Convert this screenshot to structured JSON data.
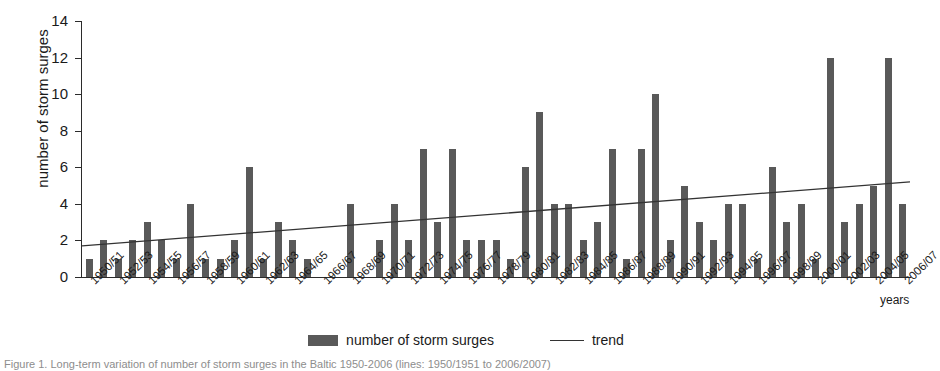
{
  "chart_data": {
    "type": "bar",
    "title": "",
    "xlabel": "years",
    "ylabel": "number of storm surges",
    "ylim": [
      0,
      14
    ],
    "yticks": [
      0,
      2,
      4,
      6,
      8,
      10,
      12,
      14
    ],
    "grid": false,
    "legend_position": "bottom",
    "categories": [
      "1950/51",
      "1951/52",
      "1952/53",
      "1953/54",
      "1954/55",
      "1955/56",
      "1956/57",
      "1957/58",
      "1958/59",
      "1959/60",
      "1960/61",
      "1961/62",
      "1962/63",
      "1963/64",
      "1964/65",
      "1965/66",
      "1966/67",
      "1967/68",
      "1968/69",
      "1969/70",
      "1970/71",
      "1971/72",
      "1972/73",
      "1973/74",
      "1974/75",
      "1975/76",
      "1976/77",
      "1977/78",
      "1978/79",
      "1979/80",
      "1980/81",
      "1981/82",
      "1982/83",
      "1983/84",
      "1984/85",
      "1985/86",
      "1986/87",
      "1987/88",
      "1988/89",
      "1989/90",
      "1990/91",
      "1991/92",
      "1992/93",
      "1993/94",
      "1994/95",
      "1995/96",
      "1996/97",
      "1997/98",
      "1998/99",
      "1999/00",
      "2000/01",
      "2001/02",
      "2002/03",
      "2003/04",
      "2004/05",
      "2005/06",
      "2006/07"
    ],
    "tick_labels": [
      "1950/51",
      "1952/53",
      "1954/55",
      "1956/57",
      "1958/59",
      "1960/61",
      "1962/63",
      "1964/65",
      "1966/67",
      "1968/69",
      "1970/71",
      "1972/73",
      "1974/75",
      "1976/77",
      "1978/79",
      "1980/81",
      "1982/83",
      "1984/85",
      "1986/87",
      "1988/89",
      "1990/91",
      "1992/93",
      "1994/95",
      "1996/97",
      "1998/99",
      "2000/01",
      "2002/03",
      "2004/05",
      "2006/07"
    ],
    "series": [
      {
        "name": "number of storm surges",
        "color": "#595959",
        "values": [
          1,
          2,
          1,
          2,
          3,
          2,
          1,
          4,
          1,
          1,
          2,
          6,
          1,
          3,
          2,
          1,
          0,
          0,
          4,
          0,
          2,
          4,
          2,
          7,
          3,
          7,
          2,
          2,
          2,
          1,
          6,
          9,
          4,
          4,
          2,
          3,
          7,
          1,
          7,
          10,
          2,
          5,
          3,
          2,
          4,
          4,
          1,
          6,
          3,
          4,
          1,
          12,
          3,
          4,
          5,
          12,
          4
        ]
      }
    ],
    "trend": {
      "name": "trend",
      "color": "#333333",
      "start_value": 1.7,
      "end_value": 5.2
    }
  },
  "legend": {
    "bars_label": "number of storm surges",
    "trend_label": "trend"
  },
  "axis": {
    "y_title": "number of storm surges",
    "x_title": "years"
  },
  "caption": {
    "text": "Figure 1. Long-term variation of number of storm surges in the Baltic 1950-2006 (lines: 1950/1951 to 2006/2007)"
  }
}
